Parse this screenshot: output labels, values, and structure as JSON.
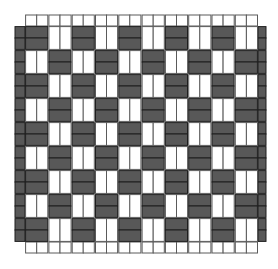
{
  "diagram": {
    "type": "basket-weave",
    "colors": {
      "background": "#ffffff",
      "warp_fill": "#ffffff",
      "warp_stroke": "#5a5a5a",
      "weft_fill": "#585858",
      "weft_stroke": "#1e1e1e"
    },
    "grid": {
      "columns": 10,
      "rows": 9,
      "origin_x": 25,
      "origin_y": 26,
      "cell_width": 23.3,
      "cell_height": 24,
      "strips_per_cell": 2,
      "edge_stub_left": 10,
      "edge_stub_right": 8,
      "edge_stub_top": 11,
      "edge_stub_bottom": 11
    }
  }
}
